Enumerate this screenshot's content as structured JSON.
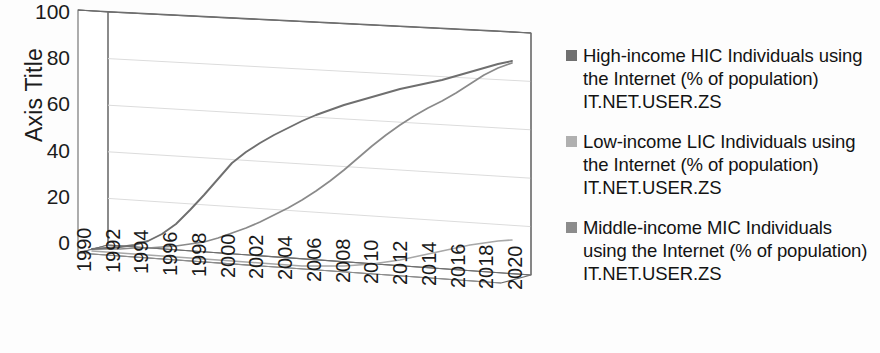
{
  "chart_data": {
    "type": "line",
    "title": "",
    "subtitle": "",
    "style": "3d-line",
    "xlabel": "",
    "ylabel": "Axis Title",
    "ylim": [
      0,
      100
    ],
    "ytick_labels": [
      "100",
      "80",
      "60",
      "40",
      "20",
      "0"
    ],
    "ytick_values": [
      100,
      80,
      60,
      40,
      20,
      0
    ],
    "grid": true,
    "legend_position": "right",
    "xtick_labels": [
      "1990",
      "1992",
      "1994",
      "1996",
      "1998",
      "2000",
      "2002",
      "2004",
      "2006",
      "2008",
      "2010",
      "2012",
      "2014",
      "2016",
      "2018",
      "2020"
    ],
    "x": [
      1990,
      1991,
      1992,
      1993,
      1994,
      1995,
      1996,
      1997,
      1998,
      1999,
      2000,
      2001,
      2002,
      2003,
      2004,
      2005,
      2006,
      2007,
      2008,
      2009,
      2010,
      2011,
      2012,
      2013,
      2014,
      2015,
      2016,
      2017,
      2018,
      2019,
      2020
    ],
    "series": [
      {
        "name": "High-income HIC Individuals using the Internet (% of population) IT.NET.USER.ZS",
        "short_name": "High-income HIC",
        "color": "#6f6f6f",
        "values": [
          0.3,
          0.6,
          1.1,
          1.8,
          3.2,
          5.5,
          9.0,
          14.0,
          19.5,
          26.0,
          33.0,
          38.5,
          43.0,
          47.0,
          51.0,
          55.0,
          58.5,
          62.0,
          65.0,
          67.5,
          70.0,
          72.0,
          74.0,
          76.0,
          78.0,
          79.5,
          81.0,
          83.0,
          85.0,
          87.0,
          88.5
        ]
      },
      {
        "name": "Low-income LIC Individuals using the Internet (% of population) IT.NET.USER.ZS",
        "short_name": "Low-income LIC",
        "color": "#a8a8a8",
        "values": [
          0.0,
          0.0,
          0.0,
          0.0,
          0.0,
          0.05,
          0.08,
          0.1,
          0.15,
          0.2,
          0.3,
          0.4,
          0.5,
          0.6,
          0.8,
          1.1,
          1.4,
          1.8,
          2.2,
          2.8,
          3.4,
          4.0,
          5.0,
          6.0,
          7.0,
          8.0,
          9.0,
          10.0,
          11.5,
          13.0,
          14.0
        ]
      },
      {
        "name": "Middle-income MIC Individuals using the Internet (% of population) IT.NET.USER.ZS",
        "short_name": "Middle-income MIC",
        "color": "#8a8a8a",
        "values": [
          0.0,
          0.0,
          0.02,
          0.05,
          0.1,
          0.2,
          0.4,
          0.7,
          1.2,
          2.0,
          3.0,
          4.2,
          5.6,
          7.0,
          8.5,
          10.5,
          12.5,
          15.0,
          17.5,
          20.5,
          24.0,
          27.5,
          31.0,
          34.5,
          38.0,
          41.5,
          45.5,
          50.0,
          54.5,
          58.5,
          62.0
        ]
      }
    ]
  },
  "legend": {
    "items": [
      {
        "label": "High-income HIC Individuals using the Internet (% of population) IT.NET.USER.ZS",
        "swatch_color": "#707070"
      },
      {
        "label": "Low-income LIC Individuals using the Internet (% of population) IT.NET.USER.ZS",
        "swatch_color": "#b0b0b0"
      },
      {
        "label": "Middle-income MIC Individuals using the Internet (% of population) IT.NET.USER.ZS",
        "swatch_color": "#8c8c8c"
      }
    ]
  }
}
